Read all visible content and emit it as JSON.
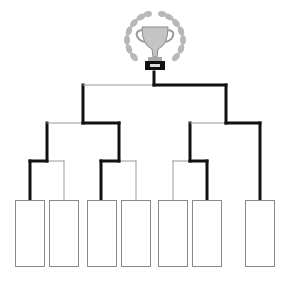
{
  "colors": {
    "winner_line": "#111111",
    "loser_line": "#9a9a9a",
    "slot_border": "#8a8a8a",
    "trophy_silver": "#bdbdbd",
    "trophy_base": "#111111"
  },
  "trophy": {
    "icon": "trophy-icon",
    "wreath": "laurel-wreath-icon"
  },
  "slots": [
    {
      "id": 1,
      "label": "",
      "x": 15,
      "y": 200,
      "w": 30,
      "h": 67
    },
    {
      "id": 2,
      "label": "",
      "x": 49,
      "y": 200,
      "w": 30,
      "h": 67
    },
    {
      "id": 3,
      "label": "",
      "x": 87,
      "y": 200,
      "w": 30,
      "h": 67
    },
    {
      "id": 4,
      "label": "",
      "x": 121,
      "y": 200,
      "w": 30,
      "h": 67
    },
    {
      "id": 5,
      "label": "",
      "x": 158,
      "y": 200,
      "w": 30,
      "h": 67
    },
    {
      "id": 6,
      "label": "",
      "x": 192,
      "y": 200,
      "w": 30,
      "h": 67
    },
    {
      "id": 7,
      "label": "",
      "x": 245,
      "y": 200,
      "w": 30,
      "h": 67
    }
  ],
  "lines": [
    {
      "x1": 30,
      "y1": 200,
      "x2": 30,
      "y2": 161,
      "win": true
    },
    {
      "x1": 64,
      "y1": 200,
      "x2": 64,
      "y2": 161,
      "win": false
    },
    {
      "x1": 30,
      "y1": 161,
      "x2": 47,
      "y2": 161,
      "win": true
    },
    {
      "x1": 47,
      "y1": 161,
      "x2": 64,
      "y2": 161,
      "win": false
    },
    {
      "x1": 101,
      "y1": 200,
      "x2": 101,
      "y2": 161,
      "win": true
    },
    {
      "x1": 136,
      "y1": 200,
      "x2": 136,
      "y2": 161,
      "win": false
    },
    {
      "x1": 101,
      "y1": 161,
      "x2": 119,
      "y2": 161,
      "win": true
    },
    {
      "x1": 119,
      "y1": 161,
      "x2": 136,
      "y2": 161,
      "win": false
    },
    {
      "x1": 173,
      "y1": 200,
      "x2": 173,
      "y2": 161,
      "win": false
    },
    {
      "x1": 207,
      "y1": 200,
      "x2": 207,
      "y2": 161,
      "win": true
    },
    {
      "x1": 173,
      "y1": 161,
      "x2": 190,
      "y2": 161,
      "win": false
    },
    {
      "x1": 190,
      "y1": 161,
      "x2": 207,
      "y2": 161,
      "win": true
    },
    {
      "x1": 47,
      "y1": 161,
      "x2": 47,
      "y2": 123,
      "win": true
    },
    {
      "x1": 119,
      "y1": 161,
      "x2": 119,
      "y2": 123,
      "win": true
    },
    {
      "x1": 47,
      "y1": 123,
      "x2": 83,
      "y2": 123,
      "win": false
    },
    {
      "x1": 83,
      "y1": 123,
      "x2": 119,
      "y2": 123,
      "win": true
    },
    {
      "x1": 190,
      "y1": 161,
      "x2": 190,
      "y2": 123,
      "win": true
    },
    {
      "x1": 260,
      "y1": 200,
      "x2": 260,
      "y2": 123,
      "win": true
    },
    {
      "x1": 190,
      "y1": 123,
      "x2": 226,
      "y2": 123,
      "win": false
    },
    {
      "x1": 226,
      "y1": 123,
      "x2": 260,
      "y2": 123,
      "win": true
    },
    {
      "x1": 83,
      "y1": 123,
      "x2": 83,
      "y2": 85,
      "win": true
    },
    {
      "x1": 226,
      "y1": 123,
      "x2": 226,
      "y2": 85,
      "win": true
    },
    {
      "x1": 83,
      "y1": 85,
      "x2": 154,
      "y2": 85,
      "win": false
    },
    {
      "x1": 154,
      "y1": 85,
      "x2": 226,
      "y2": 85,
      "win": true
    },
    {
      "x1": 154,
      "y1": 85,
      "x2": 154,
      "y2": 72,
      "win": true
    }
  ]
}
